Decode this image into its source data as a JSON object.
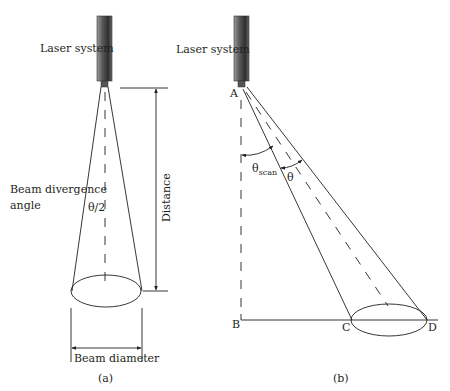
{
  "figure": {
    "panel_a": {
      "caption": "(a)",
      "laser_label": "Laser system",
      "divergence_label_line1": "Beam divergence",
      "divergence_label_line2": "angle",
      "half_angle_label": "θ/2",
      "distance_label": "Distance",
      "diameter_label": "Beam diameter"
    },
    "panel_b": {
      "caption": "(b)",
      "laser_label": "Laser system",
      "theta_scan_label": "θ",
      "theta_scan_subscript": "scan",
      "theta_label": "θ",
      "points": {
        "A": "A",
        "B": "B",
        "C": "C",
        "D": "D"
      }
    },
    "colors": {
      "line": "#231f20",
      "background": "#ffffff",
      "laser_dark": "#3a3a3a",
      "laser_light": "#9a9a9a"
    }
  }
}
